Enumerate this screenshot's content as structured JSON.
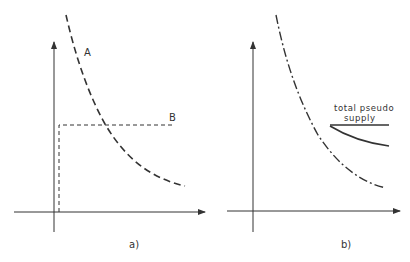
{
  "panels": [
    {
      "id": "a",
      "caption": "a)",
      "curve_label": "A",
      "line_label": "B"
    },
    {
      "id": "b",
      "caption": "b)",
      "annotation_line1": "total pseudo",
      "annotation_line2": "supply"
    }
  ],
  "colors": {
    "ink": "#333333",
    "background": "#ffffff"
  }
}
